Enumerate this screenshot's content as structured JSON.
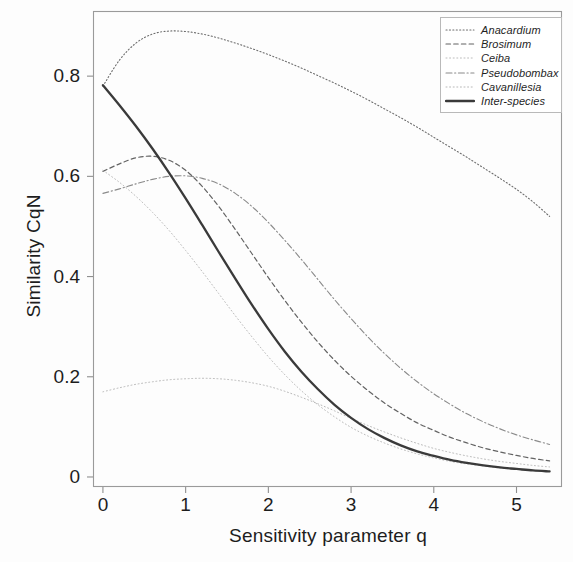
{
  "chart_data": {
    "type": "line",
    "title": "",
    "xlabel": "Sensitivity parameter q",
    "ylabel": "Similarity CqN",
    "xlim": [
      -0.12,
      5.55
    ],
    "ylim": [
      -0.02,
      0.93
    ],
    "xticks": [
      "0",
      "1",
      "2",
      "3",
      "4",
      "5"
    ],
    "xtick_values": [
      0,
      1,
      2,
      3,
      4,
      5
    ],
    "yticks": [
      "0",
      "0.2",
      "0.4",
      "0.6",
      "0.8"
    ],
    "ytick_values": [
      0,
      0.2,
      0.4,
      0.6,
      0.8
    ],
    "grid": false,
    "legend_position": "top-right",
    "x": [
      0,
      0.2,
      0.4,
      0.6,
      0.8,
      1.0,
      1.2,
      1.4,
      1.6,
      1.8,
      2.0,
      2.2,
      2.4,
      2.6,
      2.8,
      3.0,
      3.2,
      3.4,
      3.6,
      3.8,
      4.0,
      4.2,
      4.4,
      4.6,
      4.8,
      5.0,
      5.2,
      5.4
    ],
    "series": [
      {
        "name": "Anacardium",
        "style": "dotted",
        "width": 1.1,
        "color": "#6d6d6d",
        "values": [
          0.78,
          0.832,
          0.866,
          0.884,
          0.89,
          0.889,
          0.884,
          0.876,
          0.866,
          0.855,
          0.843,
          0.83,
          0.816,
          0.801,
          0.786,
          0.77,
          0.753,
          0.735,
          0.717,
          0.698,
          0.678,
          0.658,
          0.638,
          0.617,
          0.596,
          0.574,
          0.549,
          0.52
        ]
      },
      {
        "name": "Brosimum",
        "style": "dashed",
        "width": 1.2,
        "color": "#636363",
        "values": [
          0.61,
          0.625,
          0.637,
          0.64,
          0.632,
          0.612,
          0.58,
          0.54,
          0.494,
          0.446,
          0.398,
          0.352,
          0.309,
          0.269,
          0.233,
          0.201,
          0.173,
          0.148,
          0.127,
          0.108,
          0.093,
          0.079,
          0.068,
          0.058,
          0.05,
          0.043,
          0.037,
          0.032
        ]
      },
      {
        "name": "Ceiba",
        "style": "fine-dotted",
        "width": 0.9,
        "color": "#b4b4b4",
        "values": [
          0.612,
          0.588,
          0.56,
          0.528,
          0.492,
          0.452,
          0.41,
          0.366,
          0.322,
          0.28,
          0.24,
          0.204,
          0.172,
          0.144,
          0.12,
          0.099,
          0.082,
          0.068,
          0.056,
          0.046,
          0.038,
          0.031,
          0.026,
          0.022,
          0.018,
          0.015,
          0.013,
          0.011
        ]
      },
      {
        "name": "Pseudobombax",
        "style": "dash-dot",
        "width": 1.1,
        "color": "#8a8a8a",
        "values": [
          0.566,
          0.575,
          0.585,
          0.594,
          0.6,
          0.601,
          0.596,
          0.585,
          0.566,
          0.54,
          0.508,
          0.472,
          0.434,
          0.394,
          0.354,
          0.316,
          0.28,
          0.247,
          0.217,
          0.19,
          0.166,
          0.145,
          0.126,
          0.11,
          0.096,
          0.084,
          0.074,
          0.065
        ]
      },
      {
        "name": "Cavanillesia",
        "style": "fine-dotted",
        "width": 0.9,
        "color": "#b0b0b0",
        "values": [
          0.17,
          0.178,
          0.185,
          0.19,
          0.194,
          0.196,
          0.197,
          0.196,
          0.193,
          0.188,
          0.181,
          0.171,
          0.159,
          0.146,
          0.132,
          0.117,
          0.103,
          0.09,
          0.078,
          0.067,
          0.057,
          0.049,
          0.042,
          0.036,
          0.031,
          0.027,
          0.023,
          0.02
        ]
      },
      {
        "name": "Inter-species",
        "style": "solid",
        "width": 2.3,
        "color": "#3a3a3a",
        "values": [
          0.782,
          0.742,
          0.7,
          0.655,
          0.607,
          0.556,
          0.503,
          0.449,
          0.396,
          0.344,
          0.295,
          0.25,
          0.21,
          0.175,
          0.144,
          0.118,
          0.096,
          0.078,
          0.063,
          0.051,
          0.042,
          0.034,
          0.028,
          0.023,
          0.019,
          0.016,
          0.013,
          0.011
        ]
      }
    ]
  },
  "legend": {
    "entries": [
      {
        "label": "Anacardium"
      },
      {
        "label": "Brosimum"
      },
      {
        "label": "Ceiba"
      },
      {
        "label": "Pseudobombax"
      },
      {
        "label": "Cavanillesia"
      },
      {
        "label": "Inter-species"
      }
    ]
  }
}
